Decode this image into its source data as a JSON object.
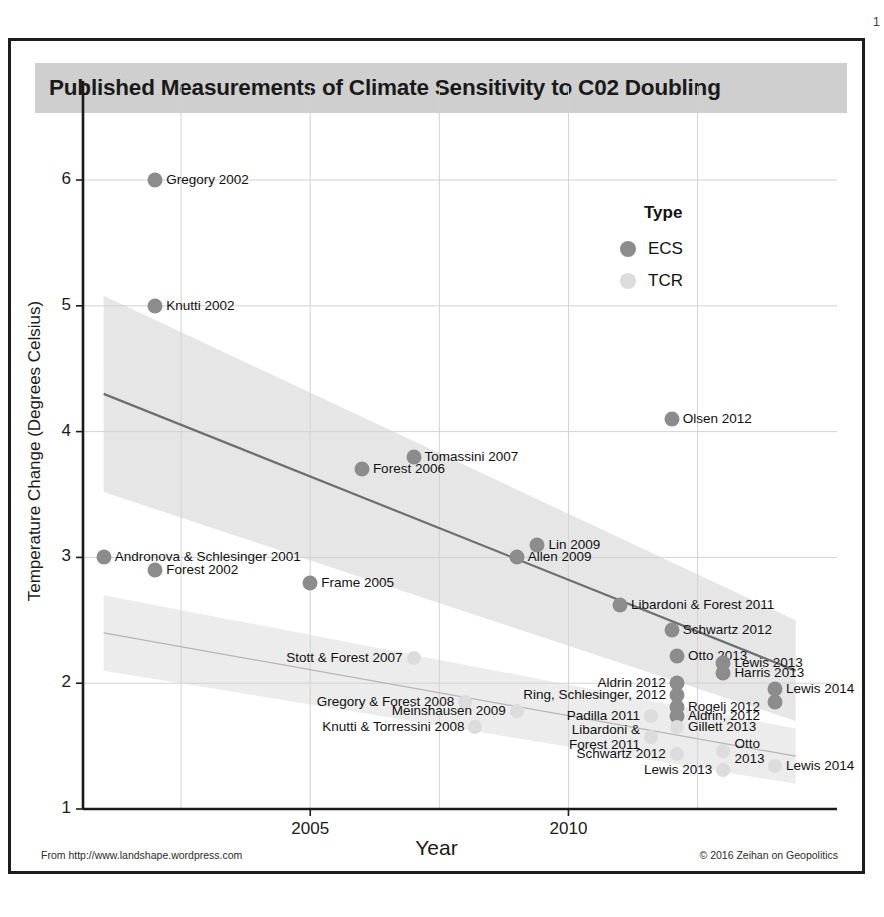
{
  "page": {
    "number": "1"
  },
  "figure": {
    "title": "Published Measurements of Climate Sensitivity to C02 Doubling",
    "footer_left": "From http://www.landshape.wordpress.com",
    "footer_right": "© 2016 Zeihan on Geopolitics"
  },
  "legend": {
    "title": "Type",
    "entries": [
      {
        "label": "ECS",
        "color": "#8c8c8c"
      },
      {
        "label": "TCR",
        "color": "#dcdcdc"
      }
    ]
  },
  "colors": {
    "ecs_point": "#8c8c8c",
    "tcr_point": "#dcdcdc",
    "ecs_band": "#e6e6e6",
    "tcr_band": "#ececec",
    "ecs_line": "#6e6e6e",
    "tcr_line": "#b5b5b5",
    "title_band": "#cfcfcf",
    "frame": "#1d1d1d",
    "grid": "#d2d2d2",
    "axis": "#1a1a1a"
  },
  "chart_data": {
    "type": "scatter",
    "title": "Published Measurements of Climate Sensitivity to C02 Doubling",
    "xlabel": "Year",
    "ylabel": "Temperature Change (Degrees Celsius)",
    "xlim": [
      2000.6,
      2015.2
    ],
    "ylim": [
      1,
      6.35
    ],
    "xticks": [
      2005,
      2010
    ],
    "xtick_labels": [
      "2005",
      "2010"
    ],
    "yticks": [
      1,
      2,
      3,
      4,
      5,
      6
    ],
    "ytick_labels": [
      "1",
      "2",
      "3",
      "4",
      "5",
      "6"
    ],
    "grid": true,
    "legend_position": "upper-right",
    "series": [
      {
        "name": "ECS",
        "color": "#8c8c8c",
        "points": [
          {
            "label": "Gregory 2002",
            "x": 2002,
            "y": 6.0,
            "anchor": "right"
          },
          {
            "label": "Knutti 2002",
            "x": 2002,
            "y": 5.0,
            "anchor": "right"
          },
          {
            "label": "Olsen 2012",
            "x": 2012,
            "y": 4.1,
            "anchor": "right"
          },
          {
            "label": "Tomassini 2007",
            "x": 2007,
            "y": 3.8,
            "anchor": "right"
          },
          {
            "label": "Forest 2006",
            "x": 2006,
            "y": 3.7,
            "anchor": "right"
          },
          {
            "label": "Lin 2009",
            "x": 2009.4,
            "y": 3.1,
            "anchor": "right"
          },
          {
            "label": "Allen 2009",
            "x": 2009,
            "y": 3.0,
            "anchor": "right"
          },
          {
            "label": "Andronova & Schlesinger 2001",
            "x": 2001,
            "y": 3.0,
            "anchor": "right"
          },
          {
            "label": "Forest 2002",
            "x": 2002,
            "y": 2.9,
            "anchor": "right"
          },
          {
            "label": "Frame 2005",
            "x": 2005,
            "y": 2.8,
            "anchor": "right"
          },
          {
            "label": "Libardoni & Forest 2011",
            "x": 2011,
            "y": 2.62,
            "anchor": "right"
          },
          {
            "label": "Schwartz 2012",
            "x": 2012,
            "y": 2.42,
            "anchor": "right"
          },
          {
            "label": "Otto 2013",
            "x": 2012.1,
            "y": 2.22,
            "anchor": "right"
          },
          {
            "label": "Lewis 2013",
            "x": 2013,
            "y": 2.16,
            "anchor": "right"
          },
          {
            "label": "Harris 2013",
            "x": 2013,
            "y": 2.08,
            "anchor": "right"
          },
          {
            "label": "Aldrin 2012",
            "x": 2012.1,
            "y": 2.0,
            "anchor": "left"
          },
          {
            "label": "Ring, Schlesinger, 2012",
            "x": 2012.1,
            "y": 1.91,
            "anchor": "left"
          },
          {
            "label": "Rogelj 2012",
            "x": 2012.1,
            "y": 1.81,
            "anchor": "right"
          },
          {
            "label": "Aldrin, 2012",
            "x": 2012.1,
            "y": 1.74,
            "anchor": "right"
          },
          {
            "label": "Lewis 2014",
            "x": 2014,
            "y": 1.95,
            "anchor": "right"
          },
          {
            "label": "Lewis 2014 b",
            "x": 2014,
            "y": 1.85,
            "anchor": "none"
          }
        ]
      },
      {
        "name": "TCR",
        "color": "#dcdcdc",
        "points": [
          {
            "label": "Stott & Forest 2007",
            "x": 2007,
            "y": 2.2,
            "anchor": "left"
          },
          {
            "label": "Gregory & Forest 2008",
            "x": 2008,
            "y": 1.85,
            "anchor": "left"
          },
          {
            "label": "Meinshausen 2009",
            "x": 2009,
            "y": 1.78,
            "anchor": "left"
          },
          {
            "label": "Knutti & Torressini 2008",
            "x": 2008.2,
            "y": 1.65,
            "anchor": "left"
          },
          {
            "label": "Padilla 2011",
            "x": 2011.6,
            "y": 1.74,
            "anchor": "left"
          },
          {
            "label": "Libardoni &\nForest 2011",
            "x": 2011.6,
            "y": 1.57,
            "anchor": "left"
          },
          {
            "label": "Gillett 2013",
            "x": 2012.1,
            "y": 1.65,
            "anchor": "right"
          },
          {
            "label": "Schwartz 2012",
            "x": 2012.1,
            "y": 1.44,
            "anchor": "left"
          },
          {
            "label": "Otto\n2013",
            "x": 2013,
            "y": 1.46,
            "anchor": "right"
          },
          {
            "label": "Lewis 2013",
            "x": 2013,
            "y": 1.31,
            "anchor": "left"
          },
          {
            "label": "Lewis 2014",
            "x": 2014,
            "y": 1.34,
            "anchor": "right"
          }
        ]
      }
    ],
    "trend_lines": [
      {
        "name": "ECS trend",
        "x0": 2001,
        "y0": 4.3,
        "x1": 2014.4,
        "y1": 2.1,
        "color": "#6e6e6e"
      },
      {
        "name": "TCR trend",
        "x0": 2001,
        "y0": 2.4,
        "x1": 2014.4,
        "y1": 1.42,
        "color": "#b5b5b5"
      }
    ],
    "confidence_bands": [
      {
        "name": "ECS band",
        "color": "#e6e6e6"
      },
      {
        "name": "TCR band",
        "color": "#ececec"
      }
    ]
  }
}
